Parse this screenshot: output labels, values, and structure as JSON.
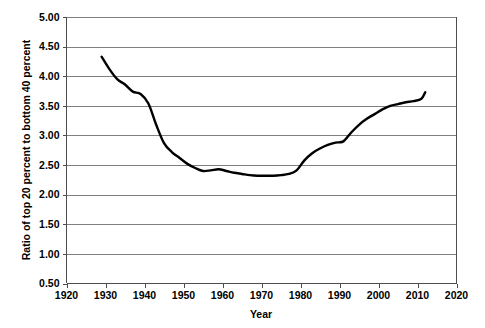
{
  "chart_data": {
    "type": "line",
    "title": "",
    "subtitle": "",
    "xlabel": "Year",
    "ylabel": "Ratio of top 20 percent to bottom 40 percent",
    "xlim": [
      1920,
      2020
    ],
    "ylim": [
      0.5,
      5.0
    ],
    "xticks": [
      1920,
      1930,
      1940,
      1950,
      1960,
      1970,
      1980,
      1990,
      2000,
      2010,
      2020
    ],
    "xtick_labels": [
      "1920",
      "1930",
      "1940",
      "1950",
      "1960",
      "1970",
      "1980",
      "1990",
      "2000",
      "2010",
      "2020"
    ],
    "yticks": [
      0.5,
      1.0,
      1.5,
      2.0,
      2.5,
      3.0,
      3.5,
      4.0,
      4.5,
      5.0
    ],
    "ytick_labels": [
      "0.50",
      "1.00",
      "1.50",
      "2.00",
      "2.50",
      "3.00",
      "3.50",
      "4.00",
      "4.50",
      "5.00"
    ],
    "grid": "horizontal",
    "legend": "none",
    "annotations": [],
    "series": [
      {
        "name": "Ratio of top 20 percent to bottom 40 percent",
        "color": "#000000",
        "x": [
          1929,
          1931,
          1933,
          1935,
          1937,
          1939,
          1941,
          1943,
          1945,
          1947,
          1949,
          1951,
          1953,
          1955,
          1957,
          1959,
          1961,
          1963,
          1965,
          1967,
          1969,
          1971,
          1973,
          1975,
          1977,
          1979,
          1981,
          1983,
          1985,
          1987,
          1989,
          1991,
          1993,
          1995,
          1997,
          1999,
          2001,
          2003,
          2005,
          2007,
          2009,
          2011,
          2012
        ],
        "y": [
          4.33,
          4.12,
          3.95,
          3.86,
          3.74,
          3.7,
          3.54,
          3.18,
          2.87,
          2.72,
          2.62,
          2.52,
          2.45,
          2.4,
          2.41,
          2.43,
          2.4,
          2.37,
          2.35,
          2.33,
          2.32,
          2.32,
          2.32,
          2.33,
          2.35,
          2.41,
          2.58,
          2.7,
          2.78,
          2.84,
          2.88,
          2.9,
          3.05,
          3.18,
          3.28,
          3.36,
          3.44,
          3.5,
          3.53,
          3.56,
          3.58,
          3.62,
          3.73
        ]
      }
    ]
  },
  "axes": {
    "y_title": "Ratio of top 20 percent to bottom 40 percent",
    "x_title": "Year"
  }
}
